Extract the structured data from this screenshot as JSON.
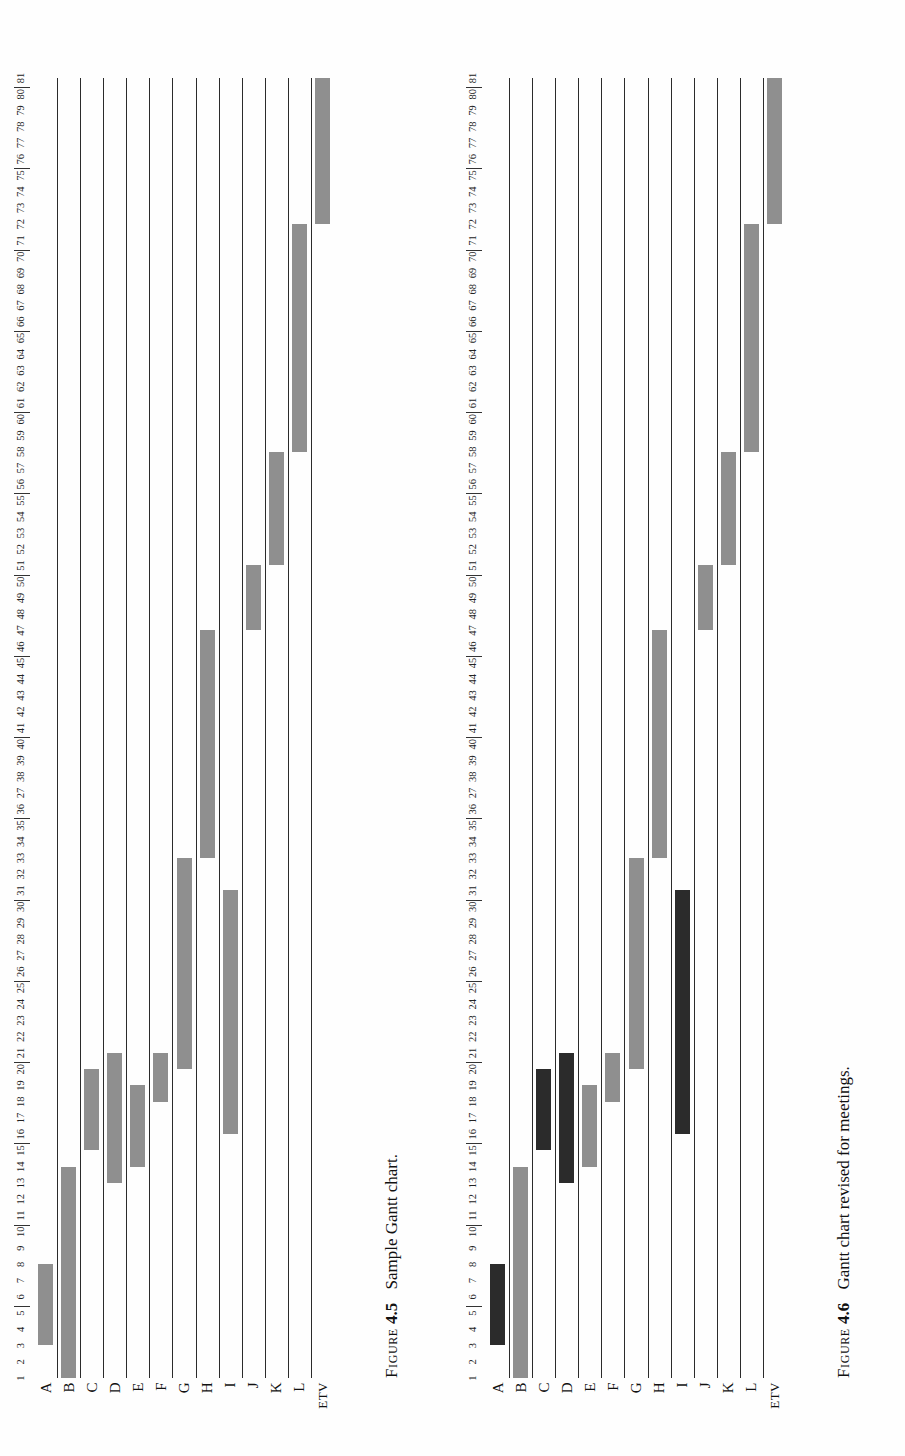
{
  "page": {
    "background": "#fefefe",
    "bar_color_light": "#8f8f8f",
    "bar_color_dark": "#2b2b2b",
    "gridline_color": "#2b2b2b"
  },
  "figures": [
    {
      "id": "figure-4-5",
      "caption_label": "Figure",
      "caption_number": "4.5",
      "caption_text": "Sample Gantt chart.",
      "row_labels": [
        "A",
        "B",
        "C",
        "D",
        "E",
        "F",
        "G",
        "H",
        "I",
        "J",
        "K",
        "L",
        "ETV"
      ],
      "axis": {
        "min": 1,
        "max": 81,
        "tick_labels": [
          "1",
          "2",
          "3",
          "4",
          "5",
          "6",
          "7",
          "8",
          "9",
          "10",
          "11",
          "12",
          "13",
          "14",
          "15",
          "16",
          "17",
          "18",
          "19",
          "20",
          "21",
          "22",
          "23",
          "24",
          "25",
          "26",
          "27",
          "28",
          "29",
          "30",
          "31",
          "32",
          "33",
          "34",
          "35",
          "36",
          "27",
          "38",
          "39",
          "40",
          "41",
          "42",
          "43",
          "44",
          "45",
          "46",
          "47",
          "48",
          "49",
          "50",
          "51",
          "52",
          "53",
          "54",
          "55",
          "56",
          "57",
          "58",
          "59",
          "60",
          "61",
          "62",
          "63",
          "64",
          "65",
          "66",
          "67",
          "68",
          "69",
          "70",
          "71",
          "72",
          "73",
          "74",
          "75",
          "76",
          "77",
          "78",
          "79",
          "80",
          "81"
        ],
        "group_separators": [
          5,
          10,
          15,
          20,
          25,
          30,
          35,
          40,
          45,
          50,
          55,
          60,
          65,
          70,
          75,
          80
        ]
      },
      "chart_data": {
        "type": "bar",
        "orientation": "horizontal-gantt",
        "title": "Sample Gantt chart",
        "xlabel": "",
        "ylabel": "",
        "xlim": [
          1,
          81
        ],
        "grid": true,
        "categories": [
          "A",
          "B",
          "C",
          "D",
          "E",
          "F",
          "G",
          "H",
          "I",
          "J",
          "K",
          "L",
          "ETV"
        ],
        "bars": [
          {
            "task": "A",
            "start": 3,
            "end": 8,
            "shade": "light"
          },
          {
            "task": "B",
            "start": 1,
            "end": 14,
            "shade": "light"
          },
          {
            "task": "C",
            "start": 15,
            "end": 20,
            "shade": "light"
          },
          {
            "task": "D",
            "start": 13,
            "end": 21,
            "shade": "light"
          },
          {
            "task": "E",
            "start": 14,
            "end": 19,
            "shade": "light"
          },
          {
            "task": "F",
            "start": 18,
            "end": 21,
            "shade": "light"
          },
          {
            "task": "G",
            "start": 20,
            "end": 33,
            "shade": "light"
          },
          {
            "task": "H",
            "start": 33,
            "end": 47,
            "shade": "light"
          },
          {
            "task": "I",
            "start": 16,
            "end": 31,
            "shade": "light"
          },
          {
            "task": "J",
            "start": 47,
            "end": 51,
            "shade": "light"
          },
          {
            "task": "K",
            "start": 51,
            "end": 58,
            "shade": "light"
          },
          {
            "task": "L",
            "start": 58,
            "end": 72,
            "shade": "light"
          },
          {
            "task": "ETV",
            "start": 72,
            "end": 81,
            "shade": "light"
          }
        ]
      }
    },
    {
      "id": "figure-4-6",
      "caption_label": "Figure",
      "caption_number": "4.6",
      "caption_text": "Gantt chart revised for meetings.",
      "row_labels": [
        "A",
        "B",
        "C",
        "D",
        "E",
        "F",
        "G",
        "H",
        "I",
        "J",
        "K",
        "L",
        "ETV"
      ],
      "axis": {
        "min": 1,
        "max": 81,
        "tick_labels": [
          "1",
          "2",
          "3",
          "4",
          "5",
          "6",
          "7",
          "8",
          "9",
          "10",
          "11",
          "12",
          "13",
          "14",
          "15",
          "16",
          "17",
          "18",
          "19",
          "20",
          "21",
          "22",
          "23",
          "24",
          "25",
          "26",
          "27",
          "28",
          "29",
          "30",
          "31",
          "32",
          "33",
          "34",
          "35",
          "36",
          "27",
          "38",
          "39",
          "40",
          "41",
          "42",
          "43",
          "44",
          "45",
          "46",
          "47",
          "48",
          "49",
          "50",
          "51",
          "52",
          "53",
          "54",
          "55",
          "56",
          "57",
          "58",
          "59",
          "60",
          "61",
          "62",
          "63",
          "64",
          "65",
          "66",
          "67",
          "68",
          "69",
          "70",
          "71",
          "72",
          "73",
          "74",
          "75",
          "76",
          "77",
          "78",
          "79",
          "80",
          "81"
        ],
        "group_separators": [
          5,
          10,
          15,
          20,
          25,
          30,
          35,
          40,
          45,
          50,
          55,
          60,
          65,
          70,
          75,
          80
        ]
      },
      "chart_data": {
        "type": "bar",
        "orientation": "horizontal-gantt",
        "title": "Gantt chart revised for meetings",
        "xlabel": "",
        "ylabel": "",
        "xlim": [
          1,
          81
        ],
        "grid": true,
        "categories": [
          "A",
          "B",
          "C",
          "D",
          "E",
          "F",
          "G",
          "H",
          "I",
          "J",
          "K",
          "L",
          "ETV"
        ],
        "bars": [
          {
            "task": "A",
            "start": 3,
            "end": 8,
            "shade": "dark"
          },
          {
            "task": "B",
            "start": 1,
            "end": 14,
            "shade": "light"
          },
          {
            "task": "C",
            "start": 15,
            "end": 20,
            "shade": "dark"
          },
          {
            "task": "D",
            "start": 13,
            "end": 21,
            "shade": "dark"
          },
          {
            "task": "E",
            "start": 14,
            "end": 19,
            "shade": "light"
          },
          {
            "task": "F",
            "start": 18,
            "end": 21,
            "shade": "light"
          },
          {
            "task": "G",
            "start": 20,
            "end": 33,
            "shade": "light"
          },
          {
            "task": "H",
            "start": 33,
            "end": 47,
            "shade": "light"
          },
          {
            "task": "I",
            "start": 16,
            "end": 31,
            "shade": "dark"
          },
          {
            "task": "J",
            "start": 47,
            "end": 51,
            "shade": "light"
          },
          {
            "task": "K",
            "start": 51,
            "end": 58,
            "shade": "light"
          },
          {
            "task": "L",
            "start": 58,
            "end": 72,
            "shade": "light"
          },
          {
            "task": "ETV",
            "start": 72,
            "end": 81,
            "shade": "light"
          }
        ]
      }
    }
  ]
}
